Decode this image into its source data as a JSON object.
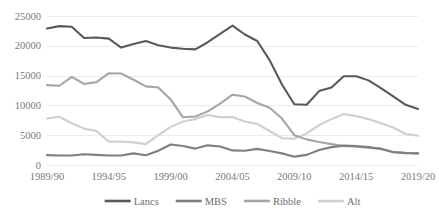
{
  "chart_data": {
    "type": "line",
    "title": "",
    "xlabel": "",
    "ylabel": "",
    "ylim": [
      0,
      25000
    ],
    "yticks": [
      0,
      5000,
      10000,
      15000,
      20000,
      25000
    ],
    "ytick_labels": [
      "0",
      "5000",
      "10000",
      "15000",
      "20000",
      "25000"
    ],
    "grid": true,
    "legend_position": "bottom",
    "x": [
      "1989/90",
      "1990/91",
      "1991/92",
      "1992/93",
      "1993/94",
      "1994/95",
      "1995/96",
      "1996/97",
      "1997/98",
      "1998/99",
      "1999/00",
      "2000/01",
      "2001/02",
      "2002/03",
      "2003/04",
      "2004/05",
      "2005/06",
      "2006/07",
      "2007/08",
      "2008/09",
      "2009/10",
      "2010/11",
      "2011/12",
      "2012/13",
      "2013/14",
      "2014/15",
      "2015/16",
      "2016/17",
      "2017/18",
      "2018/19",
      "2019/20"
    ],
    "xtick_labels": [
      "1989/90",
      "1994/95",
      "1999/00",
      "2004/05",
      "2009/10",
      "2014/15",
      "2019/20"
    ],
    "xtick_indices": [
      0,
      5,
      10,
      15,
      20,
      25,
      30
    ],
    "series": [
      {
        "name": "Lancs",
        "color": "#595959",
        "values": [
          22900,
          23300,
          23200,
          21300,
          21400,
          21200,
          19700,
          20300,
          20800,
          20100,
          19700,
          19500,
          19400,
          20600,
          22000,
          23400,
          21900,
          20800,
          17600,
          13500,
          10200,
          10100,
          12400,
          13000,
          14900,
          14900,
          14200,
          12900,
          11500,
          10100,
          9400
        ]
      },
      {
        "name": "MBS",
        "color": "#7f7f7f",
        "values": [
          1650,
          1600,
          1600,
          1800,
          1700,
          1600,
          1600,
          1950,
          1650,
          2400,
          3450,
          3200,
          2750,
          3300,
          3100,
          2450,
          2400,
          2700,
          2350,
          1950,
          1400,
          1700,
          2500,
          3000,
          3250,
          3200,
          3000,
          2700,
          2150,
          2000,
          1950
        ]
      },
      {
        "name": "Ribble",
        "color": "#a6a6a6",
        "values": [
          13400,
          13300,
          14800,
          13600,
          13900,
          15400,
          15350,
          14300,
          13200,
          13000,
          11000,
          8000,
          8150,
          9000,
          10300,
          11800,
          11500,
          10400,
          9600,
          7800,
          5000,
          4300,
          3850,
          3500,
          3200,
          3050,
          2900,
          2750,
          2200,
          2050,
          1950
        ]
      },
      {
        "name": "Alt",
        "color": "#cfcfcf",
        "values": [
          7800,
          8100,
          7000,
          6100,
          5700,
          3900,
          3950,
          3800,
          3500,
          5000,
          6400,
          7300,
          7700,
          8400,
          8000,
          8050,
          7300,
          6900,
          5700,
          4500,
          4400,
          5300,
          6700,
          7700,
          8550,
          8200,
          7700,
          7000,
          6300,
          5200,
          4900
        ]
      }
    ],
    "legend": [
      {
        "label": "Lancs",
        "color": "#595959"
      },
      {
        "label": "MBS",
        "color": "#7f7f7f"
      },
      {
        "label": "Ribble",
        "color": "#a6a6a6"
      },
      {
        "label": "Alt",
        "color": "#cfcfcf"
      }
    ],
    "style": {
      "gridline_color": "#eceaea",
      "tick_label_color": "#7a7a7a",
      "background": "#ffffff"
    }
  }
}
